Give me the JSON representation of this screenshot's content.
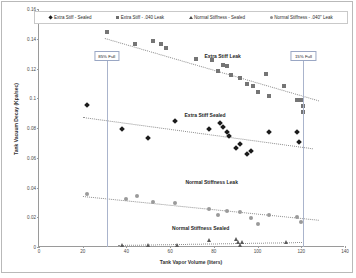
{
  "chart_data": {
    "type": "scatter",
    "title": "",
    "xlabel": "Tank Vapor Volume (liters)",
    "ylabel": "Tank Vacuum Decay (Kpa/sec)",
    "xlim": [
      0,
      140
    ],
    "ylim": [
      0,
      0.16
    ],
    "xticks": [
      "0",
      "20",
      "40",
      "60",
      "80",
      "100",
      "120",
      "140"
    ],
    "yticks": [
      "0",
      "0.02",
      "0.04",
      "0.06",
      "0.08",
      "0.1",
      "0.12",
      "0.14",
      "0.16"
    ],
    "grid": false,
    "legend_position": "top",
    "series": [
      {
        "name": "Extra Stiff - Sealed",
        "marker": "diamond",
        "color": "#1b1b1b",
        "points": [
          [
            22,
            0.0955
          ],
          [
            38,
            0.0795
          ],
          [
            50,
            0.0735
          ],
          [
            62,
            0.0845
          ],
          [
            78,
            0.0795
          ],
          [
            83,
            0.0835
          ],
          [
            84,
            0.0805
          ],
          [
            86,
            0.0775
          ],
          [
            87,
            0.0745
          ],
          [
            90,
            0.0665
          ],
          [
            92,
            0.0695
          ],
          [
            95,
            0.0625
          ],
          [
            97,
            0.0645
          ],
          [
            105,
            0.0775
          ],
          [
            118,
            0.0775
          ],
          [
            119,
            0.0705
          ]
        ],
        "trendline": {
          "x0": 20,
          "y0": 0.0875,
          "x1": 125,
          "y1": 0.0665
        }
      },
      {
        "name": "Extra Stiff - .040 Leak",
        "marker": "square",
        "color": "#757575",
        "points": [
          [
            31,
            0.1445
          ],
          [
            44,
            0.1365
          ],
          [
            52,
            0.1385
          ],
          [
            56,
            0.1365
          ],
          [
            58,
            0.1335
          ],
          [
            72,
            0.1265
          ],
          [
            79,
            0.1255
          ],
          [
            82,
            0.1185
          ],
          [
            84,
            0.1225
          ],
          [
            86,
            0.1215
          ],
          [
            88,
            0.1155
          ],
          [
            92,
            0.1135
          ],
          [
            95,
            0.1095
          ],
          [
            98,
            0.1085
          ],
          [
            100,
            0.1045
          ],
          [
            104,
            0.1165
          ],
          [
            105,
            0.1015
          ],
          [
            112,
            0.1085
          ],
          [
            118,
            0.0985
          ],
          [
            120,
            0.0985
          ],
          [
            121,
            0.0945
          ],
          [
            121,
            0.0905
          ]
        ],
        "trendline": {
          "x0": 30,
          "y0": 0.1405,
          "x1": 128,
          "y1": 0.0985
        }
      },
      {
        "name": "Normal Stiffness - .040\" Leak",
        "marker": "circle",
        "color": "#9a9a9a",
        "points": [
          [
            22,
            0.0355
          ],
          [
            40,
            0.0325
          ],
          [
            45,
            0.0345
          ],
          [
            52,
            0.0305
          ],
          [
            62,
            0.0295
          ],
          [
            78,
            0.0255
          ],
          [
            82,
            0.0215
          ],
          [
            86,
            0.0245
          ],
          [
            92,
            0.0235
          ],
          [
            97,
            0.0195
          ],
          [
            100,
            0.0155
          ],
          [
            105,
            0.0215
          ],
          [
            118,
            0.0205
          ],
          [
            120,
            0.0165
          ]
        ],
        "trendline": {
          "x0": 20,
          "y0": 0.0345,
          "x1": 128,
          "y1": 0.0185
        }
      },
      {
        "name": "Normal Stiffness - Sealed",
        "marker": "triangle",
        "color": "#5a5a5a",
        "points": [
          [
            38,
            0.0015
          ],
          [
            50,
            0.0015
          ],
          [
            63,
            0.0015
          ],
          [
            78,
            0.0045
          ],
          [
            90,
            0.0055
          ],
          [
            91,
            0.0035
          ],
          [
            92,
            0.0015
          ],
          [
            93,
            0.0035
          ],
          [
            113,
            0.0035
          ]
        ],
        "trendline": {
          "x0": 36,
          "y0": 0.0015,
          "x1": 120,
          "y1": 0.0035
        }
      }
    ],
    "annotations": [
      {
        "name": "85% Full",
        "label": "85% Full",
        "x": 31,
        "box_y": 0.1255
      },
      {
        "name": "15% Full",
        "label": "15% Full",
        "x": 121,
        "box_y": 0.1255
      }
    ],
    "series_labels": [
      {
        "label": "Extra Stiff Leak",
        "x": 84,
        "y": 0.1305
      },
      {
        "label": "Extra Stiff Sealed",
        "x": 76,
        "y": 0.0905
      },
      {
        "label": "Normal Stiffness Leak",
        "x": 79,
        "y": 0.0455
      },
      {
        "label": "Normal Stiffness Sealed",
        "x": 74,
        "y": 0.0145
      }
    ]
  },
  "legend": {
    "items": [
      {
        "label": "Extra Stiff - Sealed",
        "marker": "diamond"
      },
      {
        "label": "Extra Stiff - .040 Leak",
        "marker": "square"
      },
      {
        "label": "Normal Stiffness - Sealed",
        "marker": "triangle"
      },
      {
        "label": "Normal Stiffness - .040\" Leak",
        "marker": "circle"
      }
    ]
  }
}
